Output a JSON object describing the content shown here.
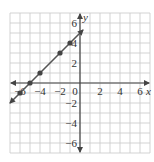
{
  "chart_data": {
    "type": "line",
    "title": "",
    "xlabel": "x",
    "ylabel": "y",
    "xlim": [
      -7,
      7
    ],
    "ylim": [
      -7,
      7
    ],
    "grid": true,
    "x_ticks": [
      -6,
      -4,
      -2,
      0,
      2,
      4,
      6
    ],
    "x_tick_labels": [
      "−6",
      "−4",
      "−2",
      "0",
      "2",
      "4",
      "6"
    ],
    "y_ticks": [
      6,
      4,
      2,
      -2,
      -4,
      -6
    ],
    "y_tick_labels": [
      "6",
      "4",
      "2",
      "−2",
      "−4",
      "−6"
    ],
    "series": [
      {
        "name": "y = x + 5",
        "line_from": [
          -7,
          -2
        ],
        "line_to": [
          0.3,
          5.3
        ],
        "arrows": "both",
        "points": [
          {
            "x": -6,
            "y": -1
          },
          {
            "x": -5,
            "y": 0
          },
          {
            "x": -4,
            "y": 1
          },
          {
            "x": -2,
            "y": 3
          },
          {
            "x": -1,
            "y": 4
          }
        ]
      }
    ],
    "legend": null
  },
  "colors": {
    "grid": "#c8c8c8",
    "axis": "#444444",
    "line": "#555555",
    "point": "#444444",
    "text": "#333333"
  }
}
